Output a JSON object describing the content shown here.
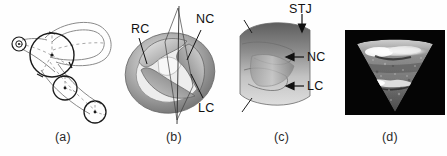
{
  "figure": {
    "kind": "scientific-figure",
    "panel_count": 4,
    "background_color": "#ffffff",
    "ink_color": "#1b1b1b"
  },
  "panels": [
    {
      "id": "a",
      "caption": "(a)",
      "type": "line-drawing",
      "description": "schematic of branching vessel with circular cross-section markers",
      "labels": []
    },
    {
      "id": "b",
      "caption": "(b)",
      "type": "three-dimensional-rendering",
      "description": "aortic valve viewed from above with cutting plane",
      "labels": [
        {
          "text": "RC",
          "x": 131,
          "y": 24
        },
        {
          "text": "NC",
          "x": 196,
          "y": 14
        },
        {
          "text": "LC",
          "x": 198,
          "y": 103
        }
      ]
    },
    {
      "id": "c",
      "caption": "(c)",
      "type": "three-dimensional-rendering",
      "description": "longitudinal cut view of valve leaflets",
      "labels": [
        {
          "text": "STJ",
          "x": 296,
          "y": 4
        },
        {
          "text": "NC",
          "x": 290,
          "y": 52
        },
        {
          "text": "LC",
          "x": 290,
          "y": 81
        }
      ]
    },
    {
      "id": "d",
      "caption": "(d)",
      "type": "ultrasound-image",
      "description": "echocardiographic sector scan of the valve",
      "labels": []
    }
  ],
  "captions": [
    {
      "id": "a",
      "text": "(a)",
      "x": 55,
      "y": 130
    },
    {
      "id": "b",
      "text": "(b)",
      "x": 166,
      "y": 130
    },
    {
      "id": "c",
      "text": "(c)",
      "x": 274,
      "y": 130
    },
    {
      "id": "d",
      "text": "(d)",
      "x": 382,
      "y": 130
    }
  ],
  "colors": {
    "ink": "#1b1b1b",
    "light_gray": "#cfcfcf",
    "mid_gray": "#9a9a9a",
    "dark_gray": "#5c5c5c",
    "ultrasound_background": "#050505",
    "ultrasound_tissue": "#8e8e8e",
    "ultrasound_bright": "#f2f2f2"
  }
}
